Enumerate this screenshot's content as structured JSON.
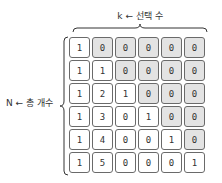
{
  "labels": {
    "top": "k ← 선택 수",
    "left": "N ← 총 개수"
  },
  "colors": {
    "shaded_cell": "#e3e3e3",
    "plain_cell": "#ffffff",
    "border": "#6a6a6a"
  },
  "grid": {
    "rows": [
      {
        "values": [
          "1",
          "0",
          "0",
          "0",
          "0",
          "0"
        ],
        "shaded": [
          false,
          true,
          true,
          true,
          true,
          true
        ]
      },
      {
        "values": [
          "1",
          "1",
          "0",
          "0",
          "0",
          "0"
        ],
        "shaded": [
          false,
          false,
          true,
          true,
          true,
          true
        ]
      },
      {
        "values": [
          "1",
          "2",
          "1",
          "0",
          "0",
          "0"
        ],
        "shaded": [
          false,
          false,
          false,
          true,
          true,
          true
        ]
      },
      {
        "values": [
          "1",
          "3",
          "0",
          "1",
          "0",
          "0"
        ],
        "shaded": [
          false,
          false,
          false,
          false,
          true,
          true
        ]
      },
      {
        "values": [
          "1",
          "4",
          "0",
          "0",
          "1",
          "0"
        ],
        "shaded": [
          false,
          false,
          false,
          false,
          false,
          true
        ]
      },
      {
        "values": [
          "1",
          "5",
          "0",
          "0",
          "0",
          "1"
        ],
        "shaded": [
          false,
          false,
          false,
          false,
          false,
          false
        ]
      }
    ]
  }
}
